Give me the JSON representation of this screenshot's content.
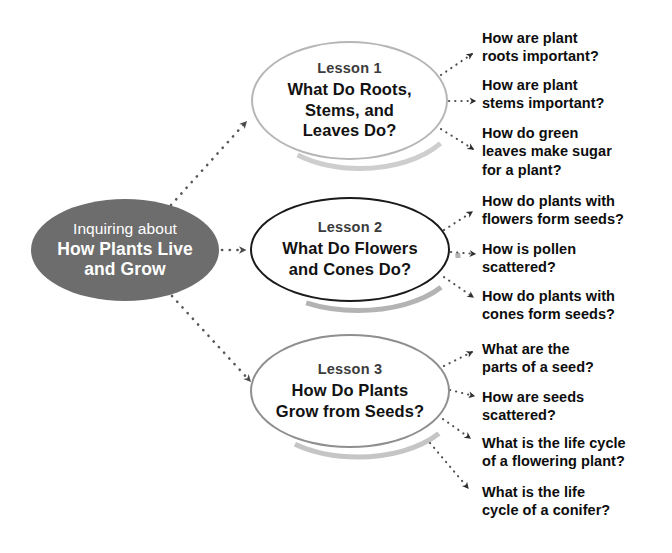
{
  "diagram": {
    "title": "Inquiring about How Plants Live and Grow",
    "center": {
      "line_1": "Inquiring about",
      "line_2": "How Plants Live",
      "line_3": "and Grow",
      "fill_color": "#6d6d6d",
      "text_color": "#ffffff"
    },
    "lessons": [
      {
        "label": "Lesson 1",
        "title_line_1": "What Do Roots,",
        "title_line_2": "Stems, and",
        "title_line_3": "Leaves Do?",
        "border_color": "#b6b6b6",
        "questions": [
          "How are plant roots important?",
          "How are plant stems important?",
          "How do green leaves make sugar for a plant?"
        ]
      },
      {
        "label": "Lesson 2",
        "title_line_1": "What Do Flowers",
        "title_line_2": "and Cones Do?",
        "title_line_3": "",
        "border_color": "#1a1a1a",
        "questions": [
          "How do plants with flowers form seeds?",
          "How is pollen scattered?",
          "How do plants with cones form seeds?"
        ]
      },
      {
        "label": "Lesson 3",
        "title_line_1": "How Do Plants",
        "title_line_2": "Grow from Seeds?",
        "title_line_3": "",
        "border_color": "#8f8f8f",
        "questions": [
          "What are the parts of a seed?",
          "How are seeds scattered?",
          "What is the life cycle of a flowering plant?",
          "What is the life cycle of a conifer?"
        ]
      }
    ],
    "questions_flat": [
      {
        "line_1": "How are plant",
        "line_2": "roots important?",
        "line_3": ""
      },
      {
        "line_1": "How are plant",
        "line_2": "stems important?",
        "line_3": ""
      },
      {
        "line_1": "How do green",
        "line_2": "leaves make sugar",
        "line_3": "for a plant?"
      },
      {
        "line_1": "How do plants with",
        "line_2": "flowers form seeds?",
        "line_3": ""
      },
      {
        "line_1": "How is pollen",
        "line_2": "scattered?",
        "line_3": ""
      },
      {
        "line_1": "How do plants with",
        "line_2": "cones form seeds?",
        "line_3": ""
      },
      {
        "line_1": "What are the",
        "line_2": "parts of a seed?",
        "line_3": ""
      },
      {
        "line_1": "How are seeds",
        "line_2": "scattered?",
        "line_3": ""
      },
      {
        "line_1": "What is the life cycle",
        "line_2": "of a flowering plant?",
        "line_3": ""
      },
      {
        "line_1": "What is the life",
        "line_2": "cycle of a conifer?",
        "line_3": ""
      }
    ],
    "connector_style": "dotted-arrow",
    "connector_color": "#5a5a5a",
    "background_color": "#ffffff"
  }
}
